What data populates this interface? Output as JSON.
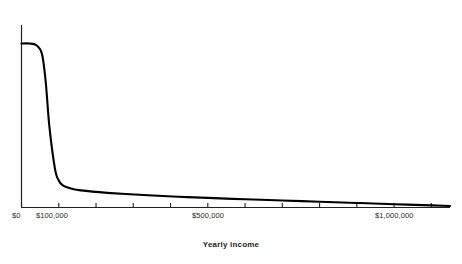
{
  "chart_data": {
    "type": "line",
    "title": "",
    "subtitle": "",
    "xlabel": "Yearly income",
    "ylabel": "",
    "xlim": [
      0,
      1150000
    ],
    "ylim": [
      0,
      1
    ],
    "grid": false,
    "legend": null,
    "annotations": [],
    "x_tick_values": [
      0,
      100000,
      200000,
      300000,
      400000,
      500000,
      600000,
      700000,
      800000,
      900000,
      1000000,
      1100000
    ],
    "x_tick_labels": [
      "$0",
      "$100,000",
      "",
      "",
      "",
      "$500,000",
      "",
      "",
      "",
      "",
      "$1,000,000",
      ""
    ],
    "y_tick_values": [],
    "y_tick_labels": [],
    "series": [
      {
        "name": "Density of yearly income",
        "x": [
          0,
          20000,
          40000,
          55000,
          65000,
          75000,
          90000,
          100000,
          110000,
          120000,
          140000,
          160000,
          190000,
          230000,
          280000,
          340000,
          420000,
          500000,
          600000,
          700000,
          800000,
          900000,
          1000000,
          1100000,
          1150000
        ],
        "values": [
          0.94,
          0.94,
          0.93,
          0.88,
          0.72,
          0.46,
          0.22,
          0.155,
          0.128,
          0.118,
          0.105,
          0.098,
          0.091,
          0.084,
          0.077,
          0.07,
          0.062,
          0.055,
          0.047,
          0.04,
          0.033,
          0.026,
          0.019,
          0.012,
          0.009
        ]
      }
    ]
  },
  "axis": {
    "x_label_text": "Yearly income",
    "tick_labels": [
      {
        "text": "$0",
        "value": 0
      },
      {
        "text": "$100,000",
        "value": 100000
      },
      {
        "text": "$500,000",
        "value": 500000
      },
      {
        "text": "$1,000,000",
        "value": 1000000
      }
    ]
  },
  "style": {
    "line_color": "#000000",
    "axis_color": "#231f20",
    "background": "#ffffff",
    "text_color": "#231f20"
  }
}
